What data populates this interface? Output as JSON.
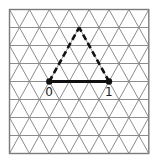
{
  "diagram": {
    "grid": {
      "type": "triangular-lattice",
      "columns": 7,
      "rows": 8,
      "line_color": "#8c8c8c",
      "border_color": "#7a7a7a"
    },
    "triangle": {
      "vertices": [
        {
          "id": "A",
          "lattice": [
            2,
            4
          ],
          "label": "0"
        },
        {
          "id": "B",
          "lattice": [
            5,
            4
          ],
          "label": "1"
        },
        {
          "id": "C",
          "lattice": [
            3.5,
            1
          ],
          "label": ""
        }
      ],
      "edges": [
        {
          "from": "A",
          "to": "B",
          "style": "solid"
        },
        {
          "from": "A",
          "to": "C",
          "style": "dashed"
        },
        {
          "from": "B",
          "to": "C",
          "style": "dashed"
        }
      ],
      "stroke_color": "#111111"
    },
    "points": [
      {
        "label": "0",
        "vertex": "A"
      },
      {
        "label": "1",
        "vertex": "B"
      }
    ]
  }
}
